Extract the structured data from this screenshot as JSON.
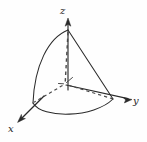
{
  "figure": {
    "title": "",
    "background_color": "#fefefe",
    "stroke_color": "#2a2a2a",
    "axes": [
      {
        "name": "z",
        "label": "z",
        "direction": "up",
        "arrow": true,
        "from": [
          68,
          88
        ],
        "to": [
          68,
          20
        ]
      },
      {
        "name": "y",
        "label": "y",
        "direction": "right",
        "arrow": true,
        "from": [
          66,
          85
        ],
        "to": [
          131,
          99
        ]
      },
      {
        "name": "x",
        "label": "x",
        "direction": "down-left",
        "arrow": true,
        "from": [
          40,
          100
        ],
        "to": [
          18,
          122
        ]
      }
    ],
    "solid": {
      "description": "cone-like solid region in the first octant",
      "apex": [
        68,
        30
      ],
      "left_vertex": [
        33,
        103
      ],
      "right_vertex": [
        113,
        99
      ],
      "left_edge": "curve",
      "right_edge": "line",
      "base_edge": "arc"
    },
    "hidden_lines": [
      {
        "name": "axis-of-symmetry",
        "from": [
          68,
          32
        ],
        "to": [
          65,
          84
        ],
        "style": "dashed"
      },
      {
        "name": "radius-to-left-vertex",
        "from": [
          65,
          84
        ],
        "to": [
          33,
          103
        ],
        "style": "dashed"
      },
      {
        "name": "radius-to-right-vertex",
        "from": [
          65,
          84
        ],
        "to": [
          113,
          99
        ],
        "style": "dashed"
      }
    ],
    "origin_marker": {
      "name": "origin-tick",
      "at": [
        65,
        84
      ]
    }
  }
}
